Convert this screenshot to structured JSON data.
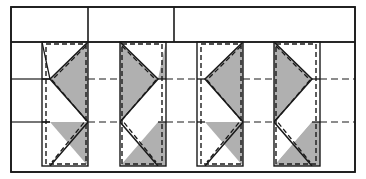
{
  "diagram": {
    "type": "technical-line-drawing",
    "canvas": {
      "width": 366,
      "height": 179
    },
    "colors": {
      "stroke": "#1a1a1a",
      "fill_gray": "#b0b0b0",
      "fill_white": "#ffffff",
      "background": "#ffffff"
    },
    "stroke_widths": {
      "frame": 1.6,
      "outline": 1.4,
      "dashed": 1.4,
      "centerline": 1.2
    },
    "dash_patterns": {
      "module_outline": "5,3",
      "centerline": "7,4"
    },
    "frame": {
      "name": "outer-frame",
      "x": 11,
      "y": 7,
      "width": 344,
      "height": 165
    },
    "top_band": {
      "name": "header-band",
      "y_top": 7,
      "y_bottom": 42,
      "cell_count": 3,
      "dividers_x": [
        88,
        174
      ],
      "cells": [
        {
          "label": "",
          "x_start": 11,
          "x_end": 88
        },
        {
          "label": "",
          "x_start": 88,
          "x_end": 174
        },
        {
          "label": "",
          "x_start": 174,
          "x_end": 355
        }
      ]
    },
    "centerlines": [
      {
        "name": "upper-centerline",
        "y": 79,
        "x_start": 11,
        "x_end": 355
      },
      {
        "name": "lower-centerline",
        "y": 122,
        "x_start": 11,
        "x_end": 355
      }
    ],
    "left_edge_ticks": [
      {
        "name": "left-tick-upper",
        "y": 79
      },
      {
        "name": "left-tick-lower",
        "y": 122
      }
    ],
    "modules": [
      {
        "id": 1,
        "name": "bracing-module-1",
        "x": 42,
        "width": 46,
        "y_top": 42,
        "y_bottom": 166,
        "orientation": "left",
        "mirrored": false
      },
      {
        "id": 2,
        "name": "bracing-module-2",
        "x": 120,
        "width": 46,
        "y_top": 42,
        "y_bottom": 166,
        "orientation": "right",
        "mirrored": true
      },
      {
        "id": 3,
        "name": "bracing-module-3",
        "x": 197,
        "width": 46,
        "y_top": 42,
        "y_bottom": 166,
        "orientation": "left",
        "mirrored": false
      },
      {
        "id": 4,
        "name": "bracing-module-4",
        "x": 274,
        "width": 46,
        "y_top": 42,
        "y_bottom": 166,
        "orientation": "right",
        "mirrored": true
      }
    ],
    "module_geometry": {
      "apex_rows": [
        79,
        122
      ],
      "band_rows": [
        42,
        79,
        122,
        166
      ],
      "description": "Each module is a tall rectangle filled gray with white chevron wedges; solid zig-zag brace lines overlay a dashed rectangular outline."
    },
    "legend": {
      "gray_meaning": "shaded panel infill",
      "dashed_meaning": "hidden / deformed outline",
      "solid_meaning": "brace member"
    }
  }
}
